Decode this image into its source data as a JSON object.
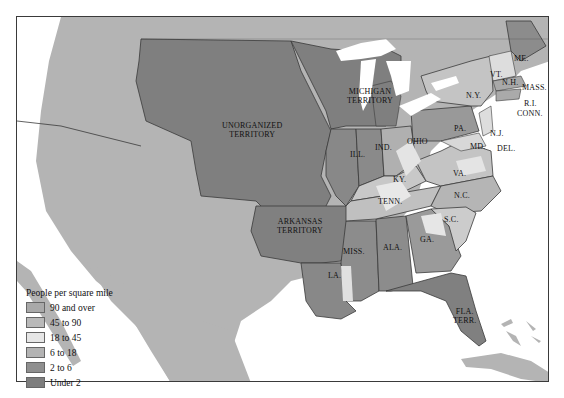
{
  "map": {
    "regions": {
      "unorganized": "UNORGANIZED TERRITORY",
      "unorganized_l1": "UNORGANIZED",
      "unorganized_l2": "TERRITORY",
      "michigan_l1": "MICHIGAN",
      "michigan_l2": "TERRITORY",
      "arkansas_l1": "ARKANSAS",
      "arkansas_l2": "TERRITORY",
      "florida_l1": "FLA.",
      "florida_l2": "TERR.",
      "me": "ME.",
      "vt": "VT.",
      "nh": "N.H.",
      "mass": "MASS.",
      "ri": "R.I.",
      "conn": "CONN.",
      "ny": "N.Y.",
      "pa": "PA.",
      "nj": "N.J.",
      "md": "MD.",
      "del": "DEL.",
      "ohio": "OHIO",
      "ind": "IND.",
      "ill": "ILL.",
      "ky": "KY.",
      "va": "VA.",
      "nc": "N.C.",
      "tenn": "TENN.",
      "sc": "S.C.",
      "ga": "GA.",
      "ala": "ALA.",
      "miss": "MISS.",
      "la": "LA."
    }
  },
  "legend": {
    "title": "People per square mile",
    "items": [
      {
        "label": "90 and over",
        "color": "#a9a9a9"
      },
      {
        "label": "45 to 90",
        "color": "#b9b9b9"
      },
      {
        "label": "18 to 45",
        "color": "#e6e6e6"
      },
      {
        "label": "6 to 18",
        "color": "#b3b3b3"
      },
      {
        "label": "2 to 6",
        "color": "#8f8f8f"
      },
      {
        "label": "Under 2",
        "color": "#7e7e7e"
      }
    ]
  },
  "colors": {
    "water": "#ffffff",
    "foreign_land": "#b4b4b4",
    "under2": "#7f7f7f",
    "two_to_six": "#909090",
    "six_to_18": "#b0b0b0",
    "eighteen_to_45": "#e4e4e4",
    "border": "#3a3a3a"
  }
}
